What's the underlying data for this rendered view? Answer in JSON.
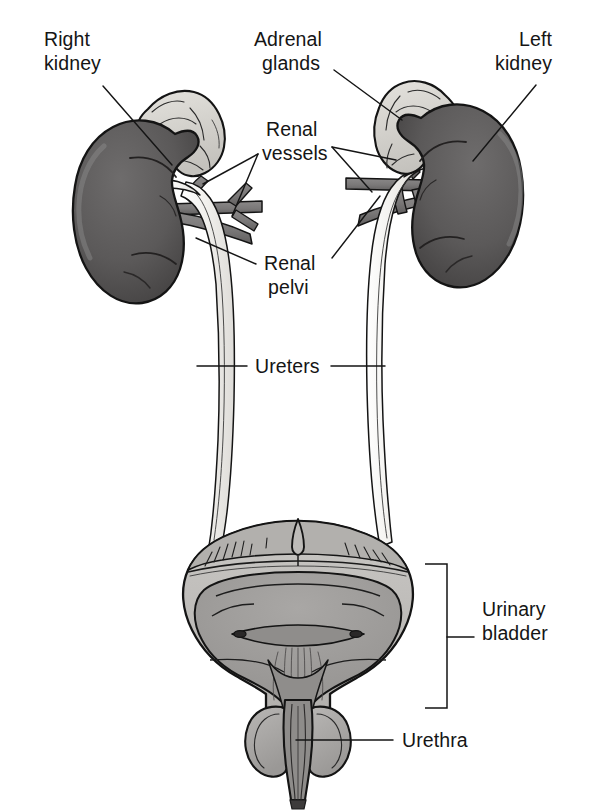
{
  "figure": {
    "type": "anatomical-diagram",
    "view": "anterior",
    "background_color": "#ffffff",
    "line_color": "#151515"
  },
  "palette": {
    "kidney_fill": "#595757",
    "kidney_shade_dark": "#454343",
    "kidney_highlight": "#6e6c6c",
    "adrenal_fill": "#d9d7d2",
    "adrenal_shade": "#c2c0bb",
    "vessel_fill": "#7c7a7a",
    "vessel_dark": "#676565",
    "ureter_fill": "#f0efec",
    "ureter_edge": "#1a1a1a",
    "bladder_wall": "#b9b7b4",
    "bladder_lumen": "#9c9a98",
    "bladder_outer": "#cecccA",
    "prostate_fill": "#a9a7a5",
    "text_color": "#151515"
  },
  "labels": [
    {
      "id": "right-kidney",
      "line1": "Right",
      "line2": "kidney",
      "x": 44,
      "y": 46,
      "align": "start",
      "leader": "M 103,86 L 172,165"
    },
    {
      "id": "adrenal-glands",
      "line1": "Adrenal",
      "line2": "glands",
      "x": 254,
      "y": 46,
      "align": "start",
      "leader": "M 334,70 L 402,120"
    },
    {
      "id": "left-kidney",
      "line1": "Left",
      "line2": "kidney",
      "x": 542,
      "y": 46,
      "align": "end",
      "leader": "M 536,85 L 473,161"
    },
    {
      "id": "renal-vessels",
      "line1": "Renal",
      "line2": "vessels",
      "x": 266,
      "y": 120,
      "align": "start",
      "leader_left_a": "M 258,154 L 205,186",
      "leader_left_b": "M 258,154 L 230,212",
      "leader_right_a": "M 330,148 L 392,160",
      "leader_right_b": "M 330,148 L 370,188"
    },
    {
      "id": "renal-pelvi",
      "line1": "Renal",
      "line2": "pelvi",
      "x": 264,
      "y": 254,
      "align": "start",
      "leader_left": "M 258,266 L 198,243",
      "leader_right": "M 330,260 L 378,202"
    },
    {
      "id": "ureters",
      "line1": "Ureters",
      "line2": "",
      "x": 255,
      "y": 358,
      "align": "start",
      "leader_left": "M 247,366 L 198,366",
      "leader_right": "M 330,366 L 386,366"
    },
    {
      "id": "urinary-bladder",
      "line1": "Urinary",
      "line2": "bladder",
      "x": 482,
      "y": 608,
      "align": "start",
      "bracket": "M 426,565 L 447,565 L 447,707 L 426,707",
      "leader": "M 447,637 L 474,637"
    },
    {
      "id": "urethra",
      "line1": "Urethra",
      "line2": "",
      "x": 400,
      "y": 733,
      "align": "start",
      "leader": "M 392,740 L 297,740"
    }
  ],
  "structures": [
    {
      "id": "right-kidney-body",
      "name": "Right kidney"
    },
    {
      "id": "left-kidney-body",
      "name": "Left kidney"
    },
    {
      "id": "right-adrenal-gland",
      "name": "Right adrenal gland"
    },
    {
      "id": "left-adrenal-gland",
      "name": "Left adrenal gland"
    },
    {
      "id": "right-renal-vessels",
      "name": "Right renal vessels"
    },
    {
      "id": "left-renal-vessels",
      "name": "Left renal vessels"
    },
    {
      "id": "right-renal-pelvis",
      "name": "Right renal pelvis"
    },
    {
      "id": "left-renal-pelvis",
      "name": "Left renal pelvis"
    },
    {
      "id": "right-ureter",
      "name": "Right ureter"
    },
    {
      "id": "left-ureter",
      "name": "Left ureter"
    },
    {
      "id": "urinary-bladder-body",
      "name": "Urinary bladder"
    },
    {
      "id": "bladder-trigone",
      "name": "Bladder trigone"
    },
    {
      "id": "urethra-tube",
      "name": "Urethra"
    },
    {
      "id": "prostate-gland",
      "name": "Prostate gland"
    }
  ]
}
